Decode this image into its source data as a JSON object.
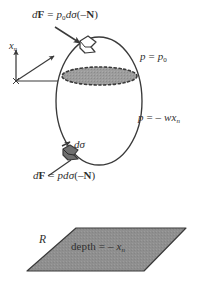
{
  "figure": {
    "colors": {
      "ink": "#2f2f2f",
      "outline": "#3a3a3a",
      "surface_band_fill": "#9a9a9a",
      "region_fill": "#8f8f8f",
      "background": "#ffffff"
    },
    "labels": {
      "force_top": {
        "name": "dF = p0 d-sigma (-N)",
        "parts": {
          "d": "d",
          "F": "F",
          "equals": " = ",
          "p": "p",
          "p_sub": "0",
          "dsigma": "dσ",
          "arg_open": "(–",
          "N": "N",
          "arg_close": ")"
        }
      },
      "axis": {
        "name": "x_n axis",
        "symbol": "x",
        "symbol_sub": "n"
      },
      "pressure_top": {
        "name": "p = p0",
        "parts": {
          "p": "p",
          "equals": " = ",
          "p_right": "p",
          "p_right_sub": "0"
        }
      },
      "pressure_side": {
        "name": "p = -w x_n",
        "parts": {
          "p": "p",
          "equals": " = – ",
          "w": "w",
          "x": "x",
          "x_sub": "n"
        }
      },
      "element_area": {
        "name": "d-sigma",
        "text": "dσ"
      },
      "force_bottom": {
        "name": "dF = p d-sigma (-N)",
        "parts": {
          "d": "d",
          "F": "F",
          "equals": " = ",
          "p": "p",
          "dsigma": "dσ",
          "arg_open": "(–",
          "N": "N",
          "arg_close": ")"
        }
      },
      "region": {
        "name": "R",
        "text": "R"
      },
      "depth": {
        "name": "depth = -x_n",
        "parts": {
          "word": "depth",
          "equals": " = – ",
          "x": "x",
          "x_sub": "n"
        }
      }
    },
    "shapes": {
      "body_outline": {
        "name": "submerged-body-ellipse",
        "cx": 99,
        "cy": 101,
        "rx": 43,
        "ry": 64
      },
      "free_surface_band": {
        "name": "free-surface-band",
        "cx": 99.5,
        "cy": 76,
        "rx": 37.5,
        "ry": 9
      },
      "region_parallelogram": {
        "name": "region-R-parallelogram",
        "points": "76,228 186,228 144,271 27,271"
      },
      "axis_origin": {
        "x": 16,
        "y": 81
      },
      "patch_top": {
        "x": 85,
        "y": 45
      },
      "patch_bottom": {
        "x": 71,
        "y": 152
      }
    }
  }
}
